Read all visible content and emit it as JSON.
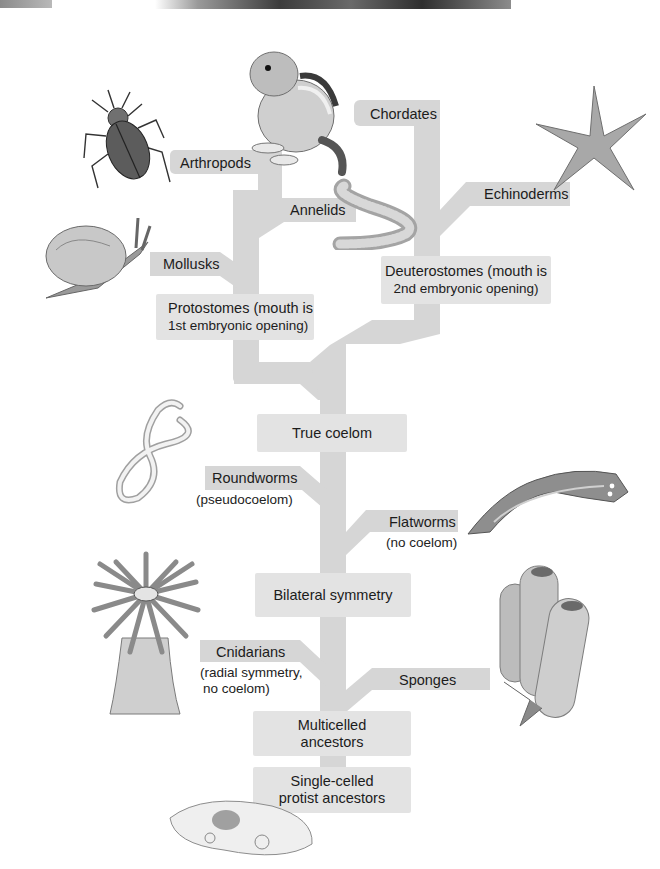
{
  "diagram": {
    "type": "phylogenetic-tree",
    "colors": {
      "branch": "#d6d6d6",
      "node_box": "#e3e3e3",
      "text": "#1c1c1c"
    },
    "root": {
      "single_celled": {
        "line1": "Single-celled",
        "line2": "protist ancestors"
      },
      "multicelled": {
        "line1": "Multicelled",
        "line2": "ancestors"
      }
    },
    "nodes": {
      "bilateral_symmetry": "Bilateral symmetry",
      "true_coelom": "True coelom",
      "protostomes": {
        "line1": "Protostomes (mouth is",
        "line2": "1st embryonic opening)"
      },
      "deuterostomes": {
        "line1": "Deuterostomes (mouth is",
        "line2": "2nd embryonic opening)"
      }
    },
    "groups": {
      "sponges": {
        "label": "Sponges",
        "icon": "sponge-illustration"
      },
      "cnidarians": {
        "label": "Cnidarians",
        "note1": "(radial symmetry,",
        "note2": "no coelom)",
        "icon": "sea-anemone-illustration"
      },
      "flatworms": {
        "label": "Flatworms",
        "note": "(no coelom)",
        "icon": "flatworm-illustration"
      },
      "roundworms": {
        "label": "Roundworms",
        "note": "(pseudocoelom)",
        "icon": "roundworm-illustration"
      },
      "mollusks": {
        "label": "Mollusks",
        "icon": "snail-illustration"
      },
      "annelids": {
        "label": "Annelids",
        "icon": "earthworm-illustration"
      },
      "arthropods": {
        "label": "Arthropods",
        "icon": "beetle-illustration"
      },
      "echinoderms": {
        "label": "Echinoderms",
        "icon": "starfish-illustration"
      },
      "chordates": {
        "label": "Chordates",
        "icon": "chipmunk-illustration"
      }
    },
    "protist_icon": "paramecium-illustration"
  }
}
